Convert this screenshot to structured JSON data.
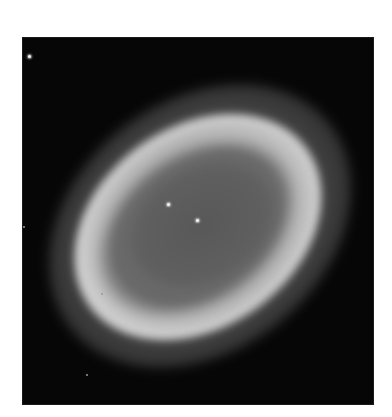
{
  "image": {
    "subject": "ring nebula",
    "rendering": "grayscale astronomical photograph",
    "background_color": "#ffffff",
    "frame_color": "#060606",
    "colors": {
      "cavity": "#5c5c5c",
      "ring": "#d7d7d7",
      "halo": "#787878",
      "star": "#f4f4f4"
    },
    "stars": [
      {
        "name": "central-star",
        "x": 197,
        "y": 220,
        "bright": true
      },
      {
        "name": "inner-star",
        "x": 168,
        "y": 204,
        "bright": true
      },
      {
        "name": "field-star-top-left",
        "x": 29,
        "y": 56,
        "bright": true
      },
      {
        "name": "field-star-left-edge",
        "x": 23,
        "y": 226,
        "bright": false
      },
      {
        "name": "field-star-ring-left",
        "x": 101,
        "y": 293,
        "bright": false
      },
      {
        "name": "field-star-lower-left",
        "x": 86,
        "y": 374,
        "bright": false
      }
    ]
  }
}
